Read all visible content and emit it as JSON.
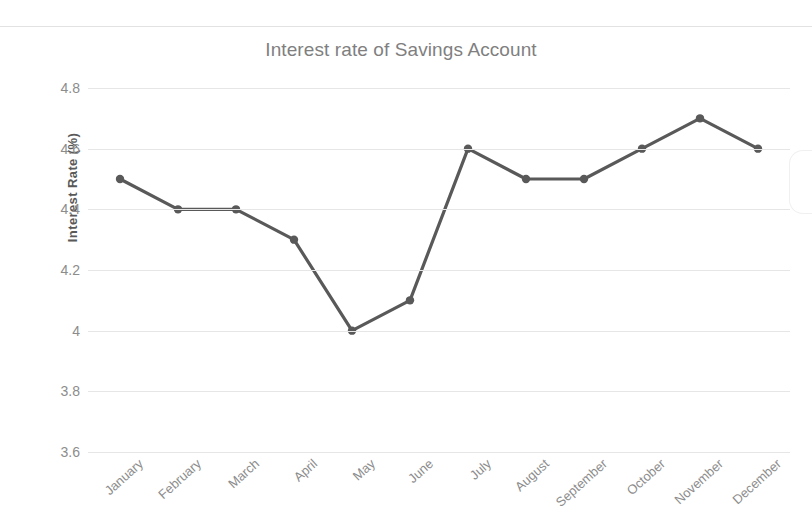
{
  "chart_data": {
    "type": "line",
    "title": "Interest rate of Savings Account",
    "xlabel": "",
    "ylabel": "Interest Rate (%)",
    "categories": [
      "January",
      "February",
      "March",
      "April",
      "May",
      "June",
      "July",
      "August",
      "September",
      "October",
      "November",
      "December"
    ],
    "values": [
      4.5,
      4.4,
      4.4,
      4.3,
      4.0,
      4.1,
      4.6,
      4.5,
      4.5,
      4.6,
      4.7,
      4.6
    ],
    "series": [
      {
        "name": "Interest Rate",
        "values": [
          4.5,
          4.4,
          4.4,
          4.3,
          4.0,
          4.1,
          4.6,
          4.5,
          4.5,
          4.6,
          4.7,
          4.6
        ]
      }
    ],
    "ylim": [
      3.6,
      4.8
    ],
    "ytick_labels": [
      "4.8",
      "4.6",
      "4.4",
      "4.2",
      "4",
      "3.8",
      "3.6"
    ],
    "ytick_values": [
      4.8,
      4.6,
      4.4,
      4.2,
      4.0,
      3.8,
      3.6
    ],
    "grid": true,
    "legend": false,
    "legend_position": "none",
    "marker": "circle",
    "colors": {
      "line": "#595959",
      "marker": "#595959",
      "grid": "#e6e6e6",
      "title_text": "#7f7f7f",
      "tick_text": "#8c8c8c",
      "axis_title_text": "#595959",
      "background": "#ffffff"
    }
  }
}
